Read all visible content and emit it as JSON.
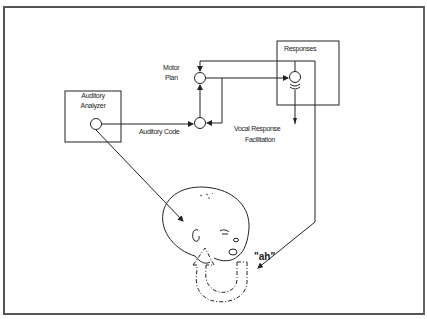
{
  "diagram": {
    "boxes": {
      "auditory_analyzer": {
        "line1": "Auditory",
        "line2": "Analyzer"
      },
      "responses": {
        "label": "Responses"
      }
    },
    "labels": {
      "motor_plan_line1": "Motor",
      "motor_plan_line2": "Plan",
      "auditory_code": "Auditory Code",
      "vocal_response_line1": "Vocal  Response",
      "vocal_response_line2": "Facilitation",
      "utterance": "\"ah\""
    },
    "colors": {
      "line": "#222222",
      "frame": "#555555",
      "background": "#ffffff"
    }
  }
}
